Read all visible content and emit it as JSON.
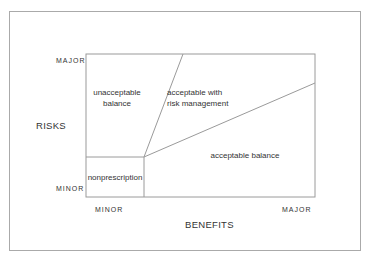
{
  "diagram": {
    "y_axis": {
      "label": "RISKS",
      "top_tick": "MAJOR",
      "bottom_tick": "MINOR"
    },
    "x_axis": {
      "label": "BENEFITS",
      "left_tick": "MINOR",
      "right_tick": "MAJOR"
    },
    "regions": [
      {
        "id": "unacceptable",
        "line1": "unacceptable",
        "line2": "balance"
      },
      {
        "id": "risk-management",
        "line1": "acceptable with",
        "line2": "risk management"
      },
      {
        "id": "acceptable",
        "line1": "acceptable balance"
      },
      {
        "id": "nonprescription",
        "line1": "nonprescription"
      }
    ],
    "colors": {
      "line": "#9a9a9a",
      "text": "#333333"
    }
  }
}
